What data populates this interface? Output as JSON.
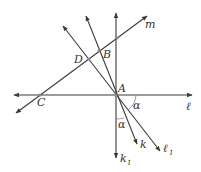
{
  "diagram": {
    "type": "geometry-construction",
    "points": {
      "A": {
        "label": "A",
        "x": 116,
        "y": 95
      },
      "B": {
        "label": "B",
        "x": 99,
        "y": 51
      },
      "C": {
        "label": "C",
        "x": 40,
        "y": 95
      },
      "D": {
        "label": "D",
        "x": 89,
        "y": 59
      }
    },
    "lines": {
      "l": {
        "label": "ℓ",
        "sub": ""
      },
      "l1": {
        "label": "ℓ",
        "sub": "1"
      },
      "m": {
        "label": "m",
        "sub": ""
      },
      "k": {
        "label": "k",
        "sub": ""
      },
      "k1": {
        "label": "k",
        "sub": "1"
      }
    },
    "angles": [
      {
        "label": "α",
        "between": "ℓ and ℓ₁"
      },
      {
        "label": "α",
        "between": "k₁ and k"
      }
    ],
    "colors": {
      "line": "#3a3a3a",
      "text": "#333333",
      "point": "#888888"
    }
  }
}
